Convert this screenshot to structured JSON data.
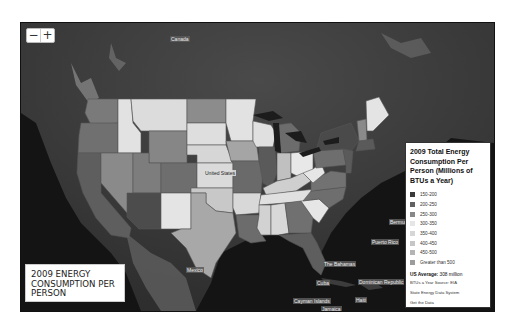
{
  "map": {
    "zoom_out_label": "−",
    "zoom_in_label": "+",
    "labels": {
      "canada": "Canada",
      "united_states": "United States",
      "mexico": "Mexico",
      "bahamas": "The Bahamas",
      "cuba": "Cuba",
      "dominican_republic": "Dominican Republic",
      "cayman_islands": "Cayman Islands",
      "jamaica": "Jamaica",
      "haiti": "Haiti",
      "puerto_rico": "Puerto Rico",
      "bermuda": "Bermuda"
    }
  },
  "title_box": {
    "text": "2009 Energy Consumption Per Person"
  },
  "legend": {
    "title": "2009 Total Energy Consumption Per Person (Millions of BTUs a Year)",
    "items": [
      {
        "label": "150-200",
        "color": "#3a3a3a"
      },
      {
        "label": "200-250",
        "color": "#616161"
      },
      {
        "label": "250-300",
        "color": "#888888"
      },
      {
        "label": "300-350",
        "color": "#e6e6e6"
      },
      {
        "label": "350-400",
        "color": "#d6d6d6"
      },
      {
        "label": "400-450",
        "color": "#c6c6c6"
      },
      {
        "label": "450-500",
        "color": "#b4b4b4"
      },
      {
        "label": "Greater than 500",
        "color": "#9c9c9c"
      }
    ],
    "average_label": "US Average:",
    "average_value": "308 million",
    "source_line1": "BTUs a Year Source: EIA",
    "source_line2": "State Energy Data System",
    "get_data_link": "Get the Data"
  },
  "chart_data": {
    "type": "choropleth",
    "title": "2009 Total Energy Consumption Per Person (Millions of BTUs a Year)",
    "region": "United States",
    "bins": [
      "150-200",
      "200-250",
      "250-300",
      "300-350",
      "350-400",
      "400-450",
      "450-500",
      "Greater than 500"
    ],
    "us_average": "308 million BTUs a Year",
    "source": "EIA State Energy Data System"
  }
}
